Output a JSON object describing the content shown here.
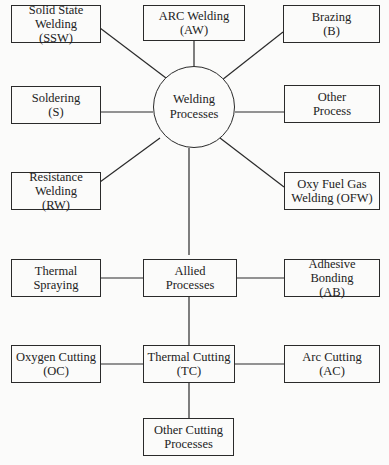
{
  "diagram": {
    "center": {
      "lines": [
        "Welding",
        "Processes"
      ]
    },
    "welding_nodes": [
      {
        "id": "ssw",
        "lines": [
          "Solid State",
          "Welding",
          "(SSW)"
        ]
      },
      {
        "id": "aw",
        "lines": [
          "ARC Welding",
          "(AW)"
        ]
      },
      {
        "id": "b",
        "lines": [
          "Brazing",
          "(B)"
        ]
      },
      {
        "id": "s",
        "lines": [
          "Soldering",
          "(S)"
        ]
      },
      {
        "id": "op",
        "lines": [
          "Other",
          "Process"
        ]
      },
      {
        "id": "rw",
        "lines": [
          "Resistance",
          "Welding",
          "(RW)"
        ]
      },
      {
        "id": "ofw",
        "lines": [
          "Oxy Fuel Gas",
          "Welding (OFW)"
        ]
      }
    ],
    "allied": {
      "lines": [
        "Allied",
        "Processes"
      ]
    },
    "allied_nodes": [
      {
        "id": "ts",
        "lines": [
          "Thermal",
          "Spraying"
        ]
      },
      {
        "id": "ab",
        "lines": [
          "Adhesive",
          "Bonding",
          "(AB)"
        ]
      }
    ],
    "thermal_cutting": {
      "lines": [
        "Thermal Cutting",
        "(TC)"
      ]
    },
    "cutting_nodes": [
      {
        "id": "oc",
        "lines": [
          "Oxygen Cutting",
          "(OC)"
        ]
      },
      {
        "id": "ac",
        "lines": [
          "Arc Cutting",
          "(AC)"
        ]
      },
      {
        "id": "ocp",
        "lines": [
          "Other Cutting",
          "Processes"
        ]
      }
    ]
  }
}
